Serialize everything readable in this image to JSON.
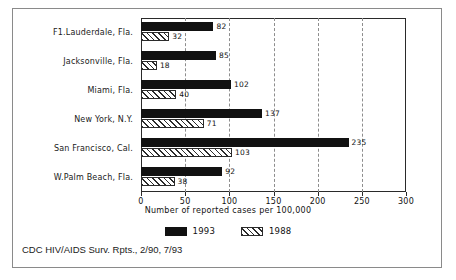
{
  "chart_data": {
    "type": "bar",
    "orientation": "horizontal",
    "title": "",
    "xlabel": "Number of reported cases per 100,000",
    "ylabel": "",
    "xlim": [
      0,
      300
    ],
    "xticks": [
      0,
      50,
      100,
      150,
      200,
      250,
      300
    ],
    "gridlines": [
      50,
      100,
      150,
      200,
      250
    ],
    "grid": true,
    "legend_position": "bottom-center",
    "categories": [
      "F1.Lauderdale, Fla.",
      "Jacksonville, Fla.",
      "Miami, Fla.",
      "New York, N.Y.",
      "San Francisco, Cal.",
      "W.Palm Beach, Fla."
    ],
    "series": [
      {
        "name": "1993",
        "color": "#111111",
        "fill": "solid",
        "values": [
          82,
          85,
          102,
          137,
          235,
          92
        ]
      },
      {
        "name": "1988",
        "color": "#2b2b2b",
        "fill": "diagonal-hatch",
        "values": [
          32,
          18,
          40,
          71,
          103,
          38
        ]
      }
    ]
  },
  "source": {
    "caption": "CDC HIV/AIDS Surv. Rpts., 2/90, 7/93"
  },
  "legend": {
    "items": [
      {
        "label": "1993"
      },
      {
        "label": "1988"
      }
    ]
  }
}
